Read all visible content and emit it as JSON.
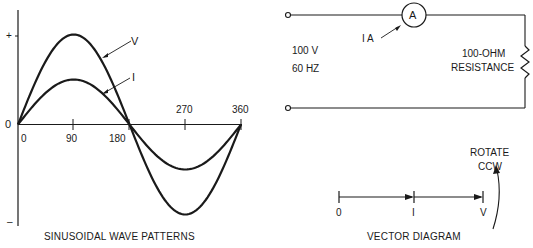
{
  "wave_panel": {
    "caption": "SINUSOIDAL WAVE PATTERNS",
    "y_axis": {
      "plus_label": "+",
      "minus_label": "–",
      "zero_label": "0"
    },
    "x_ticks": [
      "0",
      "90",
      "180",
      "270",
      "360"
    ],
    "curve_labels": {
      "voltage": "V",
      "current": "I"
    }
  },
  "circuit_panel": {
    "source_voltage": "100 V",
    "source_frequency": "60 HZ",
    "ammeter_symbol": "A",
    "ammeter_reading_label": "I  A",
    "resistor_label_line1": "100-OHM",
    "resistor_label_line2": "RESISTANCE"
  },
  "vector_panel": {
    "caption": "VECTOR DIAGRAM",
    "rotation_label_line1": "ROTATE",
    "rotation_label_line2": "CCW",
    "points": {
      "origin": "0",
      "current": "I",
      "voltage": "V"
    }
  },
  "chart_data": {
    "type": "line",
    "title": "SINUSOIDAL WAVE PATTERNS",
    "xlabel": "Degrees",
    "ylabel": "",
    "x_ticks": [
      0,
      90,
      180,
      270,
      360
    ],
    "xlim": [
      0,
      360
    ],
    "ylim": [
      "-",
      "+"
    ],
    "series": [
      {
        "name": "V",
        "function": "sine",
        "relative_amplitude": 1.0,
        "phase_deg": 0
      },
      {
        "name": "I",
        "function": "sine",
        "relative_amplitude": 0.5,
        "phase_deg": 0
      }
    ],
    "annotations": [
      "V and I in phase (resistive load)"
    ]
  }
}
